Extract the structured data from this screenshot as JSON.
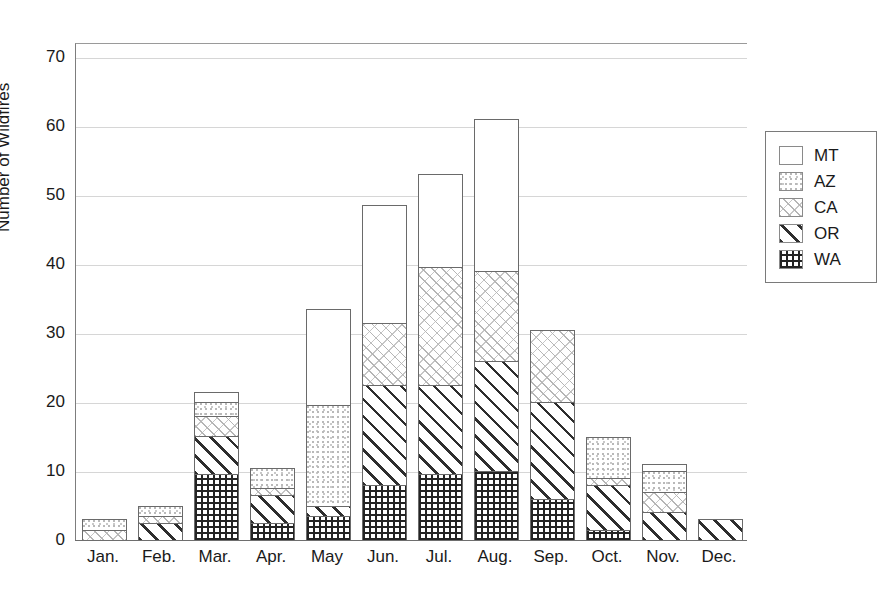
{
  "top_fragment": "",
  "chart_data": {
    "type": "bar",
    "subtype": "stacked",
    "title": "",
    "xlabel": "",
    "ylabel": "Number of Wildfires",
    "ylim": [
      0,
      72
    ],
    "yticks": [
      0,
      10,
      20,
      30,
      40,
      50,
      60,
      70
    ],
    "ytick_labels": [
      "0",
      "10",
      "20",
      "30",
      "40",
      "50",
      "60",
      "70"
    ],
    "grid": true,
    "legend_position": "right",
    "categories": [
      "Jan.",
      "Feb.",
      "Mar.",
      "Apr.",
      "May",
      "Jun.",
      "Jul.",
      "Aug.",
      "Sep.",
      "Oct.",
      "Nov.",
      "Dec."
    ],
    "series": [
      {
        "name": "WA",
        "pattern": "dense-grid",
        "values": [
          0,
          0,
          9.5,
          2.5,
          3.5,
          8,
          9.5,
          10,
          6,
          1.5,
          0,
          0
        ]
      },
      {
        "name": "OR",
        "pattern": "diagonal-lines",
        "values": [
          0,
          2.5,
          5.5,
          4,
          1.5,
          14.5,
          13,
          16,
          14,
          6.5,
          4,
          3
        ]
      },
      {
        "name": "CA",
        "pattern": "light-crosshatch",
        "values": [
          1.5,
          1,
          3,
          1,
          0,
          9,
          17,
          13,
          10.5,
          1,
          3,
          0
        ]
      },
      {
        "name": "AZ",
        "pattern": "dotted",
        "values": [
          1.5,
          1.5,
          2,
          3,
          14.5,
          0,
          0,
          0,
          0,
          6,
          3,
          0
        ]
      },
      {
        "name": "MT",
        "pattern": "blank",
        "values": [
          0,
          0,
          1.5,
          0,
          14,
          17,
          13.5,
          22,
          0,
          0,
          1,
          0
        ]
      }
    ],
    "totals": [
      3,
      5,
      21.5,
      10.5,
      33.5,
      48.5,
      53,
      61,
      30.5,
      15,
      11,
      3
    ],
    "legend": [
      {
        "label": "MT",
        "pattern": "blank"
      },
      {
        "label": "AZ",
        "pattern": "dotted"
      },
      {
        "label": "CA",
        "pattern": "light-crosshatch"
      },
      {
        "label": "OR",
        "pattern": "diagonal-lines"
      },
      {
        "label": "WA",
        "pattern": "dense-grid"
      }
    ]
  }
}
